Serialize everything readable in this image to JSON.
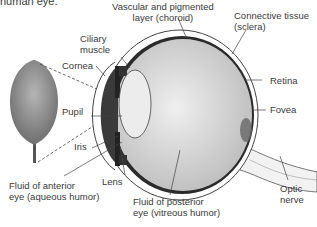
{
  "title_fragment": "human eye.",
  "labels": {
    "choroid": [
      "Vascular and pigmented",
      "layer (choroid)"
    ],
    "sclera": [
      "Connective tissue",
      "(sclera)"
    ],
    "ciliary": [
      "Ciliary",
      "muscle"
    ],
    "cornea": "Cornea",
    "pupil": "Pupil",
    "iris": "Iris",
    "retina": "Retina",
    "fovea": "Fovea",
    "lens": "Lens",
    "aqueous": [
      "Fluid of anterior",
      "eye (aqueous humor)"
    ],
    "vitreous": [
      "Fluid of posterior",
      "eye (vitreous humor)"
    ],
    "optic": [
      "Optic",
      "nerve"
    ]
  },
  "colors": {
    "line": "#555555",
    "sclera": "#ffffff",
    "choroid": "#2b2b2b",
    "vitreous": "#d4d4d4",
    "lens": "#ececec",
    "iris": "#4a4a4a",
    "tree": "#8a8a8a"
  }
}
